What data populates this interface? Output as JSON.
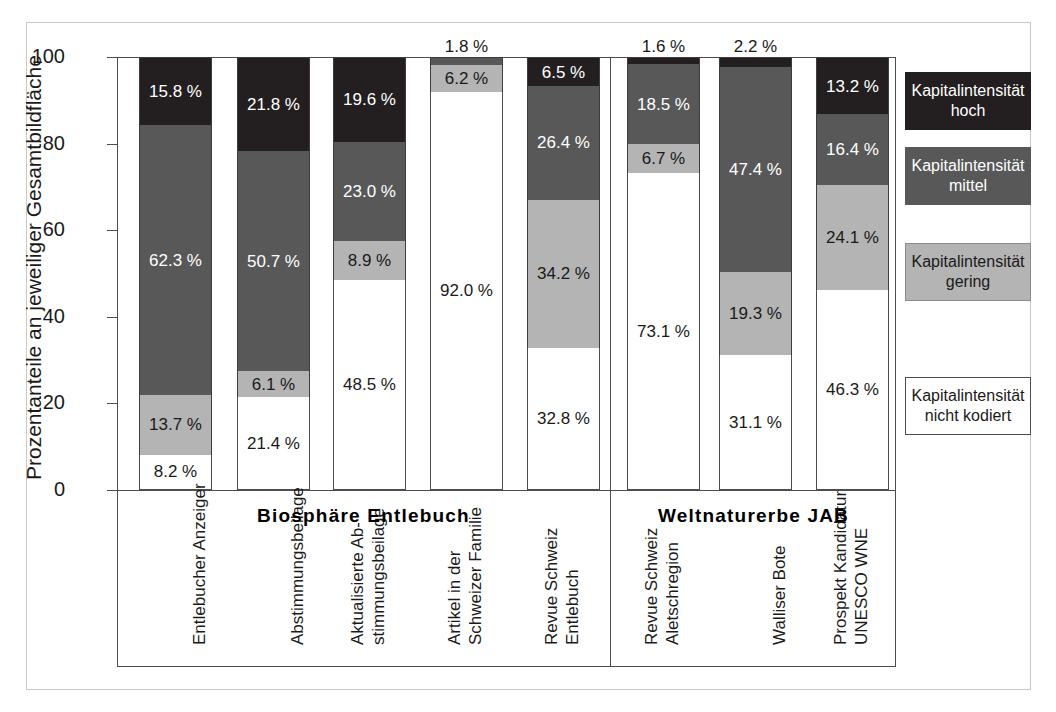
{
  "chart_data": {
    "type": "bar",
    "subtype": "stacked-bar-100",
    "title": "",
    "xlabel": "",
    "ylabel": "Prozentanteile an jeweiliger Gesamtbildfläche",
    "ylim": [
      0,
      100
    ],
    "ytick_labels": [
      "0",
      "20",
      "40",
      "60",
      "80",
      "100"
    ],
    "ytick_values": [
      0,
      20,
      40,
      60,
      80,
      100
    ],
    "grid": false,
    "legend_position": "right",
    "unit_suffix": " %",
    "categories": [
      "Entlebucher Anzeiger",
      "Abstimmungsbeilage",
      "Aktualisierte Ab-\nstimmungsbeilage",
      "Artikel in der\nSchweizer Familie",
      "Revue Schweiz\nEntlebuch",
      "Revue Schweiz\nAletschregion",
      "Walliser Bote",
      "Prospekt Kandidatur\nUNESCO WNE"
    ],
    "series": [
      {
        "name": "Kapitalintensität\nnicht kodiert",
        "key": "none",
        "color": "#ffffff",
        "values": [
          8.2,
          21.4,
          48.5,
          92.0,
          32.8,
          73.1,
          31.1,
          46.3
        ],
        "labels": [
          "8.2 %",
          "21.4 %",
          "48.5 %",
          "92.0 %",
          "32.8 %",
          "73.1 %",
          "31.1 %",
          "46.3 %"
        ]
      },
      {
        "name": "Kapitalintensität\ngering",
        "key": "gering",
        "color": "#b4b4b4",
        "values": [
          13.7,
          6.1,
          8.9,
          6.2,
          34.2,
          6.7,
          19.3,
          24.1
        ],
        "labels": [
          "13.7 %",
          "6.1 %",
          "8.9 %",
          "6.2 %",
          "34.2 %",
          "6.7 %",
          "19.3 %",
          "24.1 %"
        ]
      },
      {
        "name": "Kapitalintensität\nmittel",
        "key": "mittel",
        "color": "#585858",
        "values": [
          62.3,
          50.7,
          23.0,
          1.8,
          26.4,
          18.5,
          47.4,
          16.4
        ],
        "labels": [
          "62.3 %",
          "50.7 %",
          "23.0 %",
          "1.8 %",
          "26.4 %",
          "18.5 %",
          "47.4 %",
          "16.4 %"
        ]
      },
      {
        "name": "Kapitalintensität\nhoch",
        "key": "hoch",
        "color": "#231f20",
        "values": [
          15.8,
          21.8,
          19.6,
          0.0,
          6.5,
          1.6,
          2.2,
          13.2
        ],
        "labels": [
          "15.8 %",
          "21.8 %",
          "19.6 %",
          "",
          "6.5 %",
          "1.6 %",
          "2.2 %",
          "13.2 %"
        ]
      }
    ],
    "groups": [
      {
        "label": "Biosphäre Entlebuch",
        "categories": [
          0,
          1,
          2,
          3,
          4
        ]
      },
      {
        "label": "Weltnaturerbe JAB",
        "categories": [
          5,
          6,
          7
        ]
      }
    ],
    "legend": [
      {
        "key": "hoch",
        "label": "Kapitalintensität\nhoch",
        "color": "#231f20"
      },
      {
        "key": "mittel",
        "label": "Kapitalintensität\nmittel",
        "color": "#585858"
      },
      {
        "key": "gering",
        "label": "Kapitalintensität\ngering",
        "color": "#b4b4b4"
      },
      {
        "key": "none",
        "label": "Kapitalintensität\nnicht kodiert",
        "color": "#ffffff"
      }
    ]
  }
}
